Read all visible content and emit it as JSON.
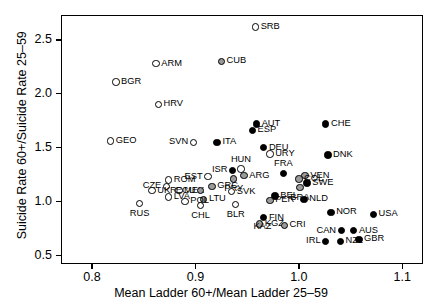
{
  "chart_data": {
    "type": "scatter",
    "title": "",
    "xlabel": "Mean Ladder 60+/Mean Ladder 25–59",
    "ylabel": "Suicide Rate 60+/Suicide Rate 25–59",
    "xlim": [
      0.77,
      1.12
    ],
    "ylim": [
      0.42,
      2.73
    ],
    "xticks": [
      0.8,
      0.9,
      1.0,
      1.1
    ],
    "xtick_labels": [
      "0.8",
      "0.9",
      "1.0",
      "1.1"
    ],
    "yticks": [
      0.5,
      1.0,
      1.5,
      2.0,
      2.5
    ],
    "ytick_labels": [
      "0.5",
      "1.0",
      "1.5",
      "2.0",
      "2.5"
    ],
    "grid": false,
    "legend": "none",
    "marker_styles": {
      "open": "hollow circle, black outline",
      "gray": "gray filled circle, black outline",
      "filled": "black filled circle"
    },
    "points": [
      {
        "label": "SRB",
        "x": 0.958,
        "y": 2.62,
        "style": "open",
        "lpos": "right"
      },
      {
        "label": "ARM",
        "x": 0.862,
        "y": 2.28,
        "style": "open",
        "lpos": "right"
      },
      {
        "label": "CUB",
        "x": 0.925,
        "y": 2.3,
        "style": "gray",
        "lpos": "right"
      },
      {
        "label": "BGR",
        "x": 0.823,
        "y": 2.11,
        "style": "open",
        "lpos": "right"
      },
      {
        "label": "HRV",
        "x": 0.864,
        "y": 1.9,
        "style": "open",
        "lpos": "right"
      },
      {
        "label": "AUT",
        "x": 0.959,
        "y": 1.72,
        "style": "filled",
        "lpos": "right"
      },
      {
        "label": "ESP",
        "x": 0.955,
        "y": 1.66,
        "style": "filled",
        "lpos": "right"
      },
      {
        "label": "CHE",
        "x": 1.026,
        "y": 1.72,
        "style": "filled",
        "lpos": "right"
      },
      {
        "label": "GEO",
        "x": 0.818,
        "y": 1.56,
        "style": "open",
        "lpos": "right"
      },
      {
        "label": "SVN",
        "x": 0.898,
        "y": 1.55,
        "style": "open",
        "lpos": "left"
      },
      {
        "label": "ITA",
        "x": 0.921,
        "y": 1.55,
        "style": "filled",
        "lpos": "right"
      },
      {
        "label": "DEU",
        "x": 0.966,
        "y": 1.5,
        "style": "filled",
        "lpos": "right"
      },
      {
        "label": "URY",
        "x": 0.972,
        "y": 1.44,
        "style": "open",
        "lpos": "right"
      },
      {
        "label": "DNK",
        "x": 1.028,
        "y": 1.43,
        "style": "filled",
        "lpos": "right"
      },
      {
        "label": "HUN",
        "x": 0.944,
        "y": 1.3,
        "style": "open",
        "lpos": "above"
      },
      {
        "label": "ISR",
        "x": 0.936,
        "y": 1.29,
        "style": "filled",
        "lpos": "left"
      },
      {
        "label": "ARG",
        "x": 0.947,
        "y": 1.24,
        "style": "gray",
        "lpos": "right"
      },
      {
        "label": "PRY",
        "x": 0.937,
        "y": 1.21,
        "style": "gray",
        "lpos": "below"
      },
      {
        "label": "FRA",
        "x": 0.985,
        "y": 1.26,
        "style": "filled",
        "lpos": "above"
      },
      {
        "label": "EST",
        "x": 0.912,
        "y": 1.23,
        "style": "open",
        "lpos": "left"
      },
      {
        "label": "VEN",
        "x": 1.006,
        "y": 1.24,
        "style": "gray",
        "lpos": "right"
      },
      {
        "label": "COL",
        "x": 1.0,
        "y": 1.21,
        "style": "gray",
        "lpos": "right"
      },
      {
        "label": "ROM",
        "x": 0.874,
        "y": 1.2,
        "style": "open",
        "lpos": "right"
      },
      {
        "label": "SWE",
        "x": 1.008,
        "y": 1.17,
        "style": "filled",
        "lpos": "right"
      },
      {
        "label": "CZE",
        "x": 0.872,
        "y": 1.14,
        "style": "open",
        "lpos": "left"
      },
      {
        "label": "GRC",
        "x": 0.916,
        "y": 1.14,
        "style": "gray",
        "lpos": "right"
      },
      {
        "label": "BRA",
        "x": 1.001,
        "y": 1.13,
        "style": "gray",
        "lpos": "below"
      },
      {
        "label": "UKR",
        "x": 0.858,
        "y": 1.1,
        "style": "open",
        "lpos": "right"
      },
      {
        "label": "MEX",
        "x": 0.884,
        "y": 1.1,
        "style": "open",
        "lpos": "right"
      },
      {
        "label": "ECU",
        "x": 0.905,
        "y": 1.1,
        "style": "gray",
        "lpos": "left"
      },
      {
        "label": "SVK",
        "x": 0.935,
        "y": 1.09,
        "style": "open",
        "lpos": "right"
      },
      {
        "label": "BEL",
        "x": 0.977,
        "y": 1.05,
        "style": "filled",
        "lpos": "right"
      },
      {
        "label": "PER",
        "x": 0.972,
        "y": 1.01,
        "style": "gray",
        "lpos": "right"
      },
      {
        "label": "NLD",
        "x": 1.005,
        "y": 1.02,
        "style": "filled",
        "lpos": "right"
      },
      {
        "label": "LVA",
        "x": 0.874,
        "y": 1.04,
        "style": "open",
        "lpos": "right"
      },
      {
        "label": "LTU",
        "x": 0.908,
        "y": 1.02,
        "style": "gray",
        "lpos": "right"
      },
      {
        "label": "POL",
        "x": 0.89,
        "y": 1.0,
        "style": "open",
        "lpos": "right"
      },
      {
        "label": "CHL",
        "x": 0.905,
        "y": 0.96,
        "style": "open",
        "lpos": "below"
      },
      {
        "label": "RUS",
        "x": 0.846,
        "y": 0.98,
        "style": "open",
        "lpos": "below"
      },
      {
        "label": "BLR",
        "x": 0.939,
        "y": 0.97,
        "style": "open",
        "lpos": "below"
      },
      {
        "label": "NOR",
        "x": 1.031,
        "y": 0.9,
        "style": "filled",
        "lpos": "right"
      },
      {
        "label": "USA",
        "x": 1.072,
        "y": 0.88,
        "style": "filled",
        "lpos": "right"
      },
      {
        "label": "FIN",
        "x": 0.966,
        "y": 0.85,
        "style": "filled",
        "lpos": "right"
      },
      {
        "label": "KGZ",
        "x": 0.962,
        "y": 0.79,
        "style": "gray",
        "lpos": "right"
      },
      {
        "label": "CRI",
        "x": 0.986,
        "y": 0.78,
        "style": "gray",
        "lpos": "right"
      },
      {
        "label": "KAZ",
        "x": 0.951,
        "y": 0.76,
        "style": "below"
      },
      {
        "label": "CAN",
        "x": 1.041,
        "y": 0.73,
        "style": "filled",
        "lpos": "left"
      },
      {
        "label": "AUS",
        "x": 1.053,
        "y": 0.73,
        "style": "filled",
        "lpos": "right"
      },
      {
        "label": "IRL",
        "x": 1.026,
        "y": 0.63,
        "style": "filled",
        "lpos": "left"
      },
      {
        "label": "NZL",
        "x": 1.04,
        "y": 0.63,
        "style": "filled",
        "lpos": "right"
      },
      {
        "label": "GBR",
        "x": 1.058,
        "y": 0.65,
        "style": "filled",
        "lpos": "right"
      }
    ]
  }
}
